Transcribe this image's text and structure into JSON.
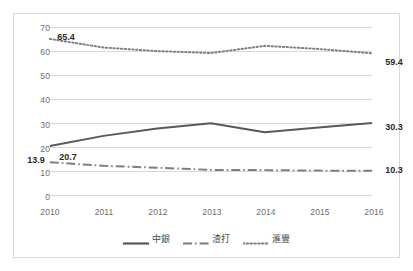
{
  "chart_data": {
    "type": "line",
    "title": "",
    "xlabel": "",
    "ylabel": "",
    "categories": [
      "2010",
      "2011",
      "2012",
      "2013",
      "2014",
      "2015",
      "2016"
    ],
    "ylim": [
      0,
      70
    ],
    "ytick_step": 10,
    "yticks": [
      "70",
      "60",
      "50",
      "40",
      "30",
      "20",
      "10",
      "0"
    ],
    "grid": true,
    "legend_position": "bottom",
    "series": [
      {
        "name": "中銀",
        "style": "solid",
        "color": "#595959",
        "values": [
          20.7,
          24.9,
          28.0,
          30.2,
          26.4,
          28.4,
          30.3
        ],
        "labels": [
          {
            "index": 0,
            "text": "20.7"
          },
          {
            "index": 6,
            "text": "30.3"
          }
        ]
      },
      {
        "name": "渣打",
        "style": "dash-dot",
        "color": "#7f7f7f",
        "values": [
          13.9,
          12.4,
          11.6,
          10.7,
          10.6,
          10.4,
          10.3
        ],
        "labels": [
          {
            "index": 0,
            "text": "13.9"
          },
          {
            "index": 6,
            "text": "10.3"
          }
        ]
      },
      {
        "name": "滙豐",
        "style": "dotted",
        "color": "#808080",
        "values": [
          65.4,
          61.8,
          60.3,
          59.5,
          62.5,
          61.2,
          59.4
        ],
        "labels": [
          {
            "index": 0,
            "text": "65.4"
          },
          {
            "index": 6,
            "text": "59.4"
          }
        ]
      }
    ]
  },
  "legend": {
    "items": [
      {
        "label": "中銀"
      },
      {
        "label": "渣打"
      },
      {
        "label": "滙豐"
      }
    ]
  },
  "colors": {
    "border": "#d9d9d9",
    "gridline": "#d9d9d9",
    "tick_text": "#6e6e6e",
    "label_text": "#2b2b2b",
    "background": "#ffffff"
  }
}
